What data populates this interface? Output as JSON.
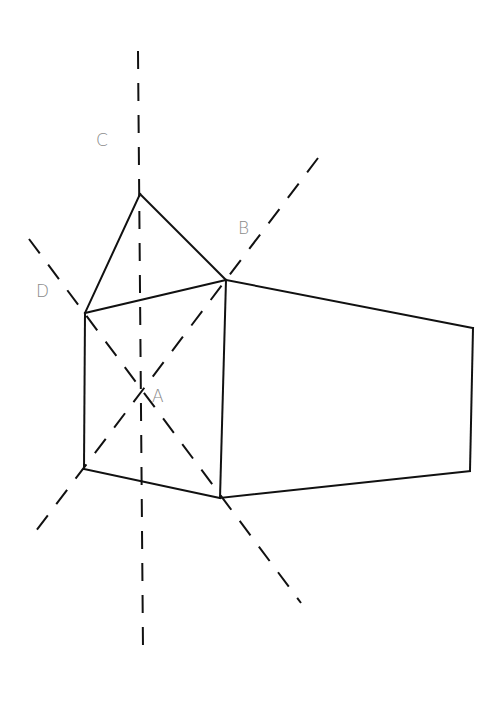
{
  "diagram": {
    "title": "",
    "line_color": "#111111",
    "label_color": "#8a8a8a",
    "labels": {
      "A": {
        "text": "A",
        "x": 152,
        "y": 402
      },
      "B": {
        "text": "B",
        "x": 238,
        "y": 234
      },
      "C": {
        "text": "C",
        "x": 96,
        "y": 146
      },
      "D": {
        "text": "D",
        "x": 36,
        "y": 297
      }
    },
    "vertices": {
      "apex": [
        140,
        194
      ],
      "front_top_left": [
        85,
        313
      ],
      "front_top_right": [
        226,
        280
      ],
      "front_bottom_left": [
        84,
        469
      ],
      "front_bottom_right": [
        220,
        498
      ],
      "back_top_right": [
        473,
        328
      ],
      "back_bottom_right": [
        470,
        471
      ],
      "center_A": [
        141,
        391
      ]
    },
    "solid_edges": [
      {
        "name": "apex-to-front-top-left",
        "from": [
          140,
          194
        ],
        "to": [
          85,
          313
        ]
      },
      {
        "name": "apex-to-front-top-right",
        "from": [
          140,
          194
        ],
        "to": [
          226,
          280
        ]
      },
      {
        "name": "front-top",
        "from": [
          85,
          313
        ],
        "to": [
          226,
          280
        ]
      },
      {
        "name": "front-left",
        "from": [
          85,
          313
        ],
        "to": [
          84,
          469
        ]
      },
      {
        "name": "front-right",
        "from": [
          226,
          280
        ],
        "to": [
          220,
          498
        ]
      },
      {
        "name": "front-bottom",
        "from": [
          84,
          469
        ],
        "to": [
          220,
          498
        ]
      },
      {
        "name": "side-top",
        "from": [
          226,
          280
        ],
        "to": [
          473,
          328
        ]
      },
      {
        "name": "side-back",
        "from": [
          473,
          328
        ],
        "to": [
          470,
          471
        ]
      },
      {
        "name": "side-bottom",
        "from": [
          220,
          498
        ],
        "to": [
          470,
          471
        ]
      }
    ],
    "dashed_axes": [
      {
        "name": "axis-C-vertical",
        "label": "C",
        "from": [
          138,
          51
        ],
        "to": [
          143,
          648
        ]
      },
      {
        "name": "axis-B-diagonal",
        "label": "B",
        "from": [
          318,
          158
        ],
        "to": [
          36,
          531
        ]
      },
      {
        "name": "axis-D-diagonal",
        "label": "D",
        "from": [
          29,
          239
        ],
        "to": [
          301,
          603
        ]
      }
    ]
  }
}
